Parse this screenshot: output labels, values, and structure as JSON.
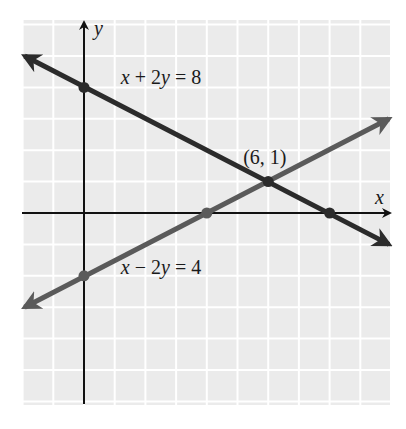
{
  "chart_data": {
    "type": "line",
    "title": "",
    "xlabel": "x",
    "ylabel": "y",
    "xlim": [
      -2,
      10
    ],
    "ylim": [
      -6,
      6.2
    ],
    "grid": true,
    "colors": {
      "background": "#ebebeb",
      "gridline": "#ffffff",
      "axis": "#111111"
    },
    "series": [
      {
        "name": "x + 2y = 8",
        "label_parts": [
          "x",
          " + 2",
          "y",
          " = 8"
        ],
        "equation": {
          "a": 1,
          "b": 2,
          "c": 8
        },
        "x_range": [
          -2,
          10
        ],
        "color": "#2b2b2b",
        "marked_points": [
          [
            0,
            4
          ],
          [
            8,
            0
          ],
          [
            6,
            1
          ]
        ]
      },
      {
        "name": "x - 2y = 4",
        "label_parts": [
          "x",
          " − 2",
          "y",
          " = 4"
        ],
        "equation": {
          "a": 1,
          "b": -2,
          "c": 4
        },
        "x_range": [
          -2,
          10
        ],
        "color": "#5a5a5a",
        "marked_points": [
          [
            0,
            -2
          ],
          [
            4,
            0
          ]
        ]
      }
    ],
    "annotations": [
      {
        "text": "(6, 1)",
        "x": 6,
        "y": 1
      }
    ]
  }
}
